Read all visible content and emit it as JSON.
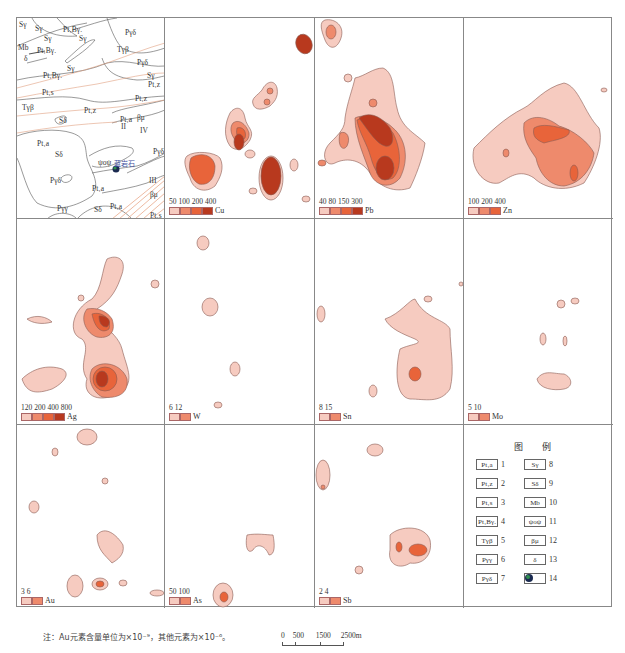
{
  "figure": {
    "note": "注：Au元素含量单位为×10⁻⁹，其他元素为×10⁻⁶。",
    "scale_bar": {
      "ticks": [
        "0",
        "500",
        "1500",
        "2500m"
      ]
    },
    "colors": {
      "level1": "#f6cbc0",
      "level2": "#ee8a6c",
      "level3": "#e8643a",
      "level4": "#b8391e",
      "contour_line": "#8a5a52",
      "geology_line": "#555555",
      "fault_line": "#e0a080"
    }
  },
  "geology_panel": {
    "labels": [
      {
        "text": "Sγ",
        "x": 2,
        "y": 2
      },
      {
        "text": "Sγ",
        "x": 18,
        "y": 6
      },
      {
        "text": "Pt₁Bγ.",
        "x": 46,
        "y": 7
      },
      {
        "text": "Mb",
        "x": 1,
        "y": 25
      },
      {
        "text": "Sγ",
        "x": 27,
        "y": 16
      },
      {
        "text": "Sγ",
        "x": 62,
        "y": 16
      },
      {
        "text": "Pt₁Bγ.",
        "x": 20,
        "y": 28
      },
      {
        "text": "Pγδ",
        "x": 108,
        "y": 10
      },
      {
        "text": "Tγβ",
        "x": 100,
        "y": 27
      },
      {
        "text": "Pγδ",
        "x": 120,
        "y": 40
      },
      {
        "text": "δ",
        "x": 7,
        "y": 36
      },
      {
        "text": "Sγ",
        "x": 50,
        "y": 46
      },
      {
        "text": "Pt₁Bγ.",
        "x": 26,
        "y": 53
      },
      {
        "text": "Sγ",
        "x": 130,
        "y": 53
      },
      {
        "text": "Pt₁z",
        "x": 131,
        "y": 62
      },
      {
        "text": "Pt₁s",
        "x": 25,
        "y": 70
      },
      {
        "text": "Pt₁z",
        "x": 118,
        "y": 76
      },
      {
        "text": "Tγβ",
        "x": 5,
        "y": 85
      },
      {
        "text": "Pt₁z",
        "x": 67,
        "y": 88
      },
      {
        "text": "Sδ",
        "x": 42,
        "y": 98
      },
      {
        "text": "Pt₁a",
        "x": 103,
        "y": 97
      },
      {
        "text": "βμ",
        "x": 120,
        "y": 95
      },
      {
        "text": "II",
        "x": 104,
        "y": 104
      },
      {
        "text": "IV",
        "x": 123,
        "y": 108
      },
      {
        "text": "Pt₁a",
        "x": 20,
        "y": 121
      },
      {
        "text": "Sδ",
        "x": 38,
        "y": 132
      },
      {
        "text": "ψoψ",
        "x": 81,
        "y": 140
      },
      {
        "text": "蓝岩石",
        "x": 97,
        "y": 140
      },
      {
        "text": "Pγδ",
        "x": 136,
        "y": 129
      },
      {
        "text": "III",
        "x": 132,
        "y": 158
      },
      {
        "text": "Pγδ",
        "x": 33,
        "y": 158
      },
      {
        "text": "Pt₁a",
        "x": 75,
        "y": 166
      },
      {
        "text": "βμ",
        "x": 133,
        "y": 172
      },
      {
        "text": "Pγγ",
        "x": 40,
        "y": 186
      },
      {
        "text": "Sδ",
        "x": 77,
        "y": 187
      },
      {
        "text": "Pt₁a",
        "x": 93,
        "y": 184
      },
      {
        "text": "Pt₁s",
        "x": 133,
        "y": 193
      }
    ]
  },
  "panels": [
    {
      "element": "Cu",
      "ticks": [
        "50",
        "100",
        "200",
        "400"
      ],
      "levels": 4
    },
    {
      "element": "Pb",
      "ticks": [
        "40",
        "80",
        "150",
        "300"
      ],
      "levels": 4
    },
    {
      "element": "Zn",
      "ticks": [
        "100",
        "200",
        "400"
      ],
      "levels": 3
    },
    {
      "element": "Ag",
      "ticks": [
        "120",
        "200",
        "400",
        "800"
      ],
      "levels": 4
    },
    {
      "element": "W",
      "ticks": [
        "6",
        "12"
      ],
      "levels": 2
    },
    {
      "element": "Sn",
      "ticks": [
        "8",
        "15"
      ],
      "levels": 2
    },
    {
      "element": "Mo",
      "ticks": [
        "5",
        "10"
      ],
      "levels": 2
    },
    {
      "element": "Au",
      "ticks": [
        "3",
        "6"
      ],
      "levels": 2
    },
    {
      "element": "As",
      "ticks": [
        "50",
        "100"
      ],
      "levels": 2
    },
    {
      "element": "Sb",
      "ticks": [
        "2",
        "4"
      ],
      "levels": 2
    }
  ],
  "map_key": {
    "title": "图 例",
    "items": [
      {
        "symbol": "Pt₁a",
        "num": "1"
      },
      {
        "symbol": "Pt₁z",
        "num": "2"
      },
      {
        "symbol": "Pt₁s",
        "num": "3"
      },
      {
        "symbol": "Pt₁Bγ.",
        "num": "4"
      },
      {
        "symbol": "Tγβ",
        "num": "5"
      },
      {
        "symbol": "Pγγ",
        "num": "6"
      },
      {
        "symbol": "Pγδ",
        "num": "7"
      },
      {
        "symbol": "Sγ",
        "num": "8"
      },
      {
        "symbol": "Sδ",
        "num": "9"
      },
      {
        "symbol": "Mb",
        "num": "10"
      },
      {
        "symbol": "ψoψ",
        "num": "11"
      },
      {
        "symbol": "βμ",
        "num": "12"
      },
      {
        "symbol": "δ",
        "num": "13"
      },
      {
        "symbol": "●",
        "num": "14"
      }
    ]
  }
}
